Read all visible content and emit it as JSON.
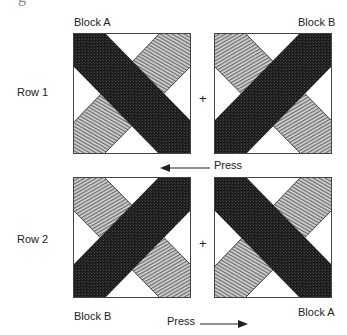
{
  "diagram": {
    "top_fragment": "g",
    "rows": [
      {
        "label": "Row 1",
        "left_block": {
          "name": "Block A",
          "dark_band": "top-left-to-bottom-right",
          "light_band": "bottom-left-to-top-right"
        },
        "operator": "+",
        "right_block": {
          "name": "Block B",
          "dark_band": "bottom-left-to-top-right",
          "light_band": "top-left-to-bottom-right"
        },
        "press": {
          "label": "Press",
          "direction": "left"
        }
      },
      {
        "label": "Row 2",
        "left_block": {
          "name": "Block B",
          "dark_band": "bottom-left-to-top-right",
          "light_band": "top-left-to-bottom-right"
        },
        "operator": "+",
        "right_block": {
          "name": "Block A",
          "dark_band": "top-left-to-bottom-right",
          "light_band": "bottom-left-to-top-right"
        },
        "press": {
          "label": "Press",
          "direction": "right"
        }
      }
    ],
    "colors": {
      "dark_band": "#1c1c1c",
      "light_band": "#9a9a9a",
      "background": "#ffffff",
      "outline": "#333333"
    }
  }
}
